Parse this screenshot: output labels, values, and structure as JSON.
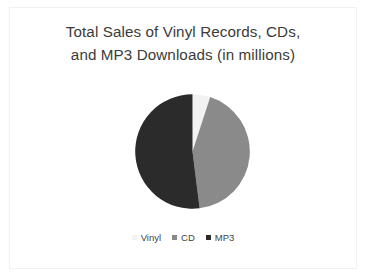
{
  "slide": {
    "background_color": "#ffffff",
    "frame_color": "#f1f1f1"
  },
  "chart_data": {
    "type": "pie",
    "title": "Total Sales of Vinyl Records, CDs,\nand MP3 Downloads (in millions)",
    "title_line_1": "Total Sales of Vinyl Records, CDs,",
    "title_line_2": "and MP3 Downloads (in millions)",
    "xlabel": "",
    "ylabel": "",
    "categories": [
      "Vinyl",
      "CD",
      "MP3"
    ],
    "values": [
      5,
      43,
      52
    ],
    "slices": [
      {
        "label": "Vinyl",
        "value": 5,
        "percent": 5,
        "color": "#f2f2f2",
        "start_angle": 0,
        "end_angle": 18
      },
      {
        "label": "CD",
        "value": 43,
        "percent": 43,
        "color": "#8a8a8a",
        "start_angle": 18,
        "end_angle": 172.8
      },
      {
        "label": "MP3",
        "value": 52,
        "percent": 52,
        "color": "#2b2b2b",
        "start_angle": 172.8,
        "end_angle": 360
      }
    ],
    "legend": {
      "position": "bottom",
      "entries": [
        {
          "label": "Vinyl",
          "color": "#f2f2f2"
        },
        {
          "label": "CD",
          "color": "#8a8a8a"
        },
        {
          "label": "MP3",
          "color": "#2b2b2b"
        }
      ]
    },
    "grid": false,
    "data_labels": false
  }
}
